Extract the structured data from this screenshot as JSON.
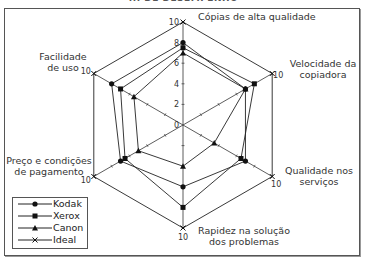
{
  "title": "... DE DESEMPENHO",
  "chart_data": {
    "type": "radar",
    "title": "",
    "categories": [
      "Cópias de alta qualidade",
      "Velocidade da copiadora",
      "Qualidade nos serviços",
      "Rapidez na solução dos problemas",
      "Preço e condições de pagamento",
      "Facilidade de uso"
    ],
    "series": [
      {
        "name": "Kodak",
        "marker": "circle",
        "values": [
          8,
          7,
          7,
          6,
          7,
          8
        ]
      },
      {
        "name": "Xerox",
        "marker": "square",
        "values": [
          7.5,
          8,
          6.5,
          8,
          6.5,
          7
        ]
      },
      {
        "name": "Canon",
        "marker": "triangle",
        "values": [
          7,
          7,
          3.5,
          4,
          5,
          5.5
        ]
      },
      {
        "name": "Ideal",
        "marker": "x",
        "values": [
          10,
          10,
          10,
          10,
          10,
          10
        ]
      }
    ],
    "rlim": [
      0,
      10
    ],
    "rticks": [
      0,
      2,
      4,
      6,
      8,
      10
    ],
    "legend_position": "lower-left"
  },
  "labels": {
    "axis0_l1": "Cópias de alta qualidade",
    "axis1_l1": "Velocidade da",
    "axis1_l2": "copiadora",
    "axis2_l1": "Qualidade nos",
    "axis2_l2": "serviços",
    "axis3_l1": "Rapidez na solução",
    "axis3_l2": "dos problemas",
    "axis4_l1": "Preço e condições",
    "axis4_l2": "de pagamento",
    "axis5_l1": "Facilidade",
    "axis5_l2": "de uso"
  },
  "legend": {
    "items": [
      "Kodak",
      "Xerox",
      "Canon",
      "Ideal"
    ]
  }
}
